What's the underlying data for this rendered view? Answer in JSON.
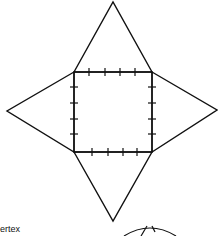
{
  "diagram": {
    "type": "net-of-square-pyramid",
    "square": {
      "x1": 74,
      "y1": 72,
      "x2": 152,
      "y2": 152
    },
    "apexes": {
      "top": [
        113,
        2
      ],
      "left": [
        7,
        111
      ],
      "right": [
        217,
        110
      ],
      "bottom": [
        113,
        221
      ]
    },
    "tick_marks_per_side": 4,
    "stroke_color": "#111111"
  },
  "labels": {
    "vertex": "ertex"
  }
}
